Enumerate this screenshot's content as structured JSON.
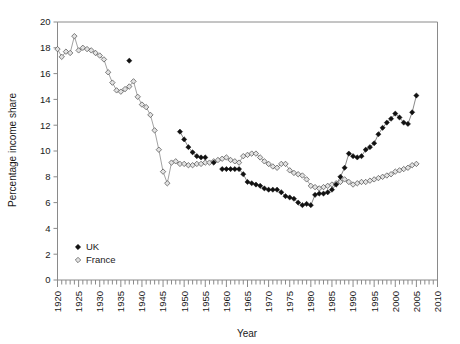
{
  "chart_data": {
    "type": "scatter",
    "title": "",
    "subtitle": "",
    "xlabel": "Year",
    "ylabel": "Percentage income share",
    "xlim": [
      1920,
      2010
    ],
    "ylim": [
      0,
      20
    ],
    "ytick_step": 2,
    "xtick_step": 5,
    "x_minor_tick_step": 1,
    "grid": false,
    "legend_position": "bottom-left",
    "yticks": [
      0,
      2,
      4,
      6,
      8,
      10,
      12,
      14,
      16,
      18,
      20
    ],
    "xticks": [
      1920,
      1925,
      1930,
      1935,
      1940,
      1945,
      1950,
      1955,
      1960,
      1965,
      1970,
      1975,
      1980,
      1985,
      1990,
      1995,
      2000,
      2005,
      2010
    ],
    "series": [
      {
        "name": "UK",
        "marker": "filled-diamond",
        "color": "#111111",
        "points": [
          [
            1937,
            17.0
          ],
          [
            1949,
            11.5
          ],
          [
            1950,
            10.9
          ],
          [
            1951,
            10.3
          ],
          [
            1952,
            9.9
          ],
          [
            1953,
            9.6
          ],
          [
            1954,
            9.5
          ],
          [
            1955,
            9.5
          ],
          [
            1957,
            9.1
          ],
          [
            1959,
            8.6
          ],
          [
            1960,
            8.6
          ],
          [
            1961,
            8.6
          ],
          [
            1962,
            8.6
          ],
          [
            1963,
            8.6
          ],
          [
            1964,
            8.2
          ],
          [
            1965,
            7.6
          ],
          [
            1966,
            7.5
          ],
          [
            1967,
            7.4
          ],
          [
            1968,
            7.3
          ],
          [
            1969,
            7.1
          ],
          [
            1970,
            7.0
          ],
          [
            1971,
            7.0
          ],
          [
            1972,
            7.0
          ],
          [
            1973,
            6.8
          ],
          [
            1974,
            6.5
          ],
          [
            1975,
            6.4
          ],
          [
            1976,
            6.3
          ],
          [
            1977,
            6.0
          ],
          [
            1978,
            5.8
          ],
          [
            1979,
            5.9
          ],
          [
            1980,
            5.8
          ],
          [
            1981,
            6.6
          ],
          [
            1982,
            6.7
          ],
          [
            1983,
            6.7
          ],
          [
            1984,
            6.8
          ],
          [
            1985,
            7.0
          ],
          [
            1986,
            7.4
          ],
          [
            1987,
            8.0
          ],
          [
            1988,
            8.7
          ],
          [
            1989,
            9.8
          ],
          [
            1990,
            9.6
          ],
          [
            1991,
            9.5
          ],
          [
            1992,
            9.6
          ],
          [
            1993,
            10.1
          ],
          [
            1994,
            10.3
          ],
          [
            1995,
            10.6
          ],
          [
            1996,
            11.3
          ],
          [
            1997,
            11.8
          ],
          [
            1998,
            12.2
          ],
          [
            1999,
            12.5
          ],
          [
            2000,
            12.9
          ],
          [
            2001,
            12.6
          ],
          [
            2002,
            12.2
          ],
          [
            2003,
            12.1
          ],
          [
            2004,
            13.0
          ],
          [
            2005,
            14.3
          ]
        ]
      },
      {
        "name": "France",
        "marker": "open-diamond",
        "color": "#e2e2e2",
        "points": [
          [
            1920,
            17.9
          ],
          [
            1921,
            17.3
          ],
          [
            1922,
            17.7
          ],
          [
            1923,
            17.6
          ],
          [
            1924,
            18.9
          ],
          [
            1925,
            17.8
          ],
          [
            1926,
            18.0
          ],
          [
            1927,
            17.9
          ],
          [
            1928,
            17.8
          ],
          [
            1929,
            17.6
          ],
          [
            1930,
            17.4
          ],
          [
            1931,
            17.1
          ],
          [
            1932,
            16.1
          ],
          [
            1933,
            15.3
          ],
          [
            1934,
            14.7
          ],
          [
            1935,
            14.6
          ],
          [
            1936,
            14.8
          ],
          [
            1937,
            15.0
          ],
          [
            1938,
            15.4
          ],
          [
            1939,
            14.2
          ],
          [
            1940,
            13.6
          ],
          [
            1941,
            13.4
          ],
          [
            1942,
            12.8
          ],
          [
            1943,
            11.6
          ],
          [
            1944,
            10.1
          ],
          [
            1945,
            8.4
          ],
          [
            1946,
            7.5
          ],
          [
            1947,
            9.1
          ],
          [
            1948,
            9.2
          ],
          [
            1949,
            9.0
          ],
          [
            1950,
            9.0
          ],
          [
            1951,
            8.9
          ],
          [
            1952,
            8.9
          ],
          [
            1953,
            9.0
          ],
          [
            1954,
            9.0
          ],
          [
            1955,
            9.1
          ],
          [
            1956,
            9.1
          ],
          [
            1957,
            9.2
          ],
          [
            1958,
            9.3
          ],
          [
            1959,
            9.4
          ],
          [
            1960,
            9.5
          ],
          [
            1961,
            9.3
          ],
          [
            1962,
            9.2
          ],
          [
            1963,
            9.1
          ],
          [
            1964,
            9.6
          ],
          [
            1965,
            9.7
          ],
          [
            1966,
            9.8
          ],
          [
            1967,
            9.8
          ],
          [
            1968,
            9.5
          ],
          [
            1969,
            9.2
          ],
          [
            1970,
            9.0
          ],
          [
            1971,
            8.8
          ],
          [
            1972,
            8.7
          ],
          [
            1973,
            9.0
          ],
          [
            1974,
            9.0
          ],
          [
            1975,
            8.5
          ],
          [
            1976,
            8.3
          ],
          [
            1977,
            8.2
          ],
          [
            1978,
            8.1
          ],
          [
            1979,
            7.8
          ],
          [
            1980,
            7.3
          ],
          [
            1981,
            7.2
          ],
          [
            1982,
            7.1
          ],
          [
            1983,
            7.2
          ],
          [
            1984,
            7.3
          ],
          [
            1985,
            7.4
          ],
          [
            1986,
            7.5
          ],
          [
            1987,
            7.6
          ],
          [
            1988,
            7.8
          ],
          [
            1989,
            7.6
          ],
          [
            1990,
            7.4
          ],
          [
            1991,
            7.5
          ],
          [
            1992,
            7.6
          ],
          [
            1993,
            7.6
          ],
          [
            1994,
            7.7
          ],
          [
            1995,
            7.8
          ],
          [
            1996,
            7.9
          ],
          [
            1997,
            8.0
          ],
          [
            1998,
            8.1
          ],
          [
            1999,
            8.2
          ],
          [
            2000,
            8.4
          ],
          [
            2001,
            8.5
          ],
          [
            2002,
            8.6
          ],
          [
            2003,
            8.7
          ],
          [
            2004,
            8.9
          ],
          [
            2005,
            9.0
          ]
        ]
      }
    ]
  },
  "legend": {
    "items": [
      {
        "label": "UK"
      },
      {
        "label": "France"
      }
    ]
  },
  "axes": {
    "x_title": "Year",
    "y_title": "Percentage income share"
  }
}
